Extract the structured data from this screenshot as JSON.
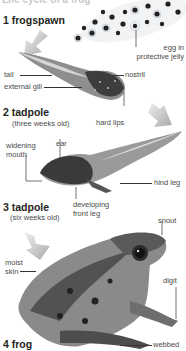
{
  "page": {
    "cut_title": "Life cycle of a frog"
  },
  "stages": [
    {
      "number": "1",
      "title": "1 frogspawn",
      "subtitle": ""
    },
    {
      "number": "2",
      "title": "2 tadpole",
      "subtitle": "(three weeks old)"
    },
    {
      "number": "3",
      "title": "3 tadpole",
      "subtitle": "(six weeks old)"
    },
    {
      "number": "4",
      "title": "4 frog",
      "subtitle": ""
    }
  ],
  "labels": {
    "egg": "egg in\nprotective jelly",
    "egg_line1": "egg in",
    "egg_line2": "protective jelly",
    "tail": "tail",
    "external_gill": "external gill",
    "nostril": "nostril",
    "hard_lips": "hard lips",
    "widening_mouth_1": "widening",
    "widening_mouth_2": "mouth",
    "ear": "ear",
    "hind_leg": "hind leg",
    "developing_front_leg_1": "developing",
    "developing_front_leg_2": "front leg",
    "snout": "snout",
    "moist_skin_1": "moist",
    "moist_skin_2": "skin",
    "digit": "digit",
    "webbed": "webbed"
  },
  "colors": {
    "text": "#231f20",
    "label": "#4a4a4a",
    "arrow": "#b5b5b5",
    "frog_dark": "#2b2b2b",
    "frog_mid": "#7a7a7a"
  }
}
